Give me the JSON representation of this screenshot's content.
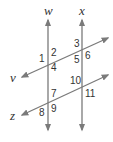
{
  "diagram": {
    "lines": [
      {
        "name": "w",
        "x1": 48,
        "y1": 20,
        "x2": 48,
        "y2": 130,
        "label_x": 44,
        "label_y": 15
      },
      {
        "name": "x",
        "x1": 82,
        "y1": 20,
        "x2": 82,
        "y2": 130,
        "label_x": 79,
        "label_y": 15
      },
      {
        "name": "v",
        "x1": 22,
        "y1": 77,
        "x2": 108,
        "y2": 38,
        "label_x": 10,
        "label_y": 82
      },
      {
        "name": "z",
        "x1": 22,
        "y1": 115,
        "x2": 108,
        "y2": 75,
        "label_x": 10,
        "label_y": 120
      }
    ],
    "angles": [
      {
        "n": "1",
        "x": 39,
        "y": 62
      },
      {
        "n": "2",
        "x": 51,
        "y": 56
      },
      {
        "n": "3",
        "x": 74,
        "y": 47
      },
      {
        "n": "4",
        "x": 51,
        "y": 71
      },
      {
        "n": "5",
        "x": 74,
        "y": 63
      },
      {
        "n": "6",
        "x": 85,
        "y": 59
      },
      {
        "n": "7",
        "x": 51,
        "y": 97
      },
      {
        "n": "8",
        "x": 39,
        "y": 116
      },
      {
        "n": "9",
        "x": 51,
        "y": 112
      },
      {
        "n": "10",
        "x": 70,
        "y": 84
      },
      {
        "n": "11",
        "x": 85,
        "y": 97
      }
    ],
    "line_color": "#7a7a7a"
  }
}
